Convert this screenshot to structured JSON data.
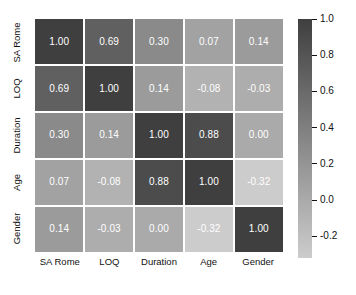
{
  "chart_data": {
    "type": "heatmap",
    "title": "",
    "subtitle": "",
    "xlabel": "",
    "ylabel": "",
    "categories_x": [
      "SA Rome",
      "LOQ",
      "Duration",
      "Age",
      "Gender"
    ],
    "categories_y": [
      "SA Rome",
      "LOQ",
      "Duration",
      "Age",
      "Gender"
    ],
    "values": [
      [
        1.0,
        0.69,
        0.3,
        0.07,
        0.14
      ],
      [
        0.69,
        1.0,
        0.14,
        -0.08,
        -0.03
      ],
      [
        0.3,
        0.14,
        1.0,
        0.88,
        0.0
      ],
      [
        0.07,
        -0.08,
        0.88,
        1.0,
        -0.32
      ],
      [
        0.14,
        -0.03,
        0.0,
        -0.32,
        1.0
      ]
    ],
    "cell_labels": [
      [
        "1.00",
        "0.69",
        "0.30",
        "0.07",
        "0.14"
      ],
      [
        "0.69",
        "1.00",
        "0.14",
        "-0.08",
        "-0.03"
      ],
      [
        "0.30",
        "0.14",
        "1.00",
        "0.88",
        "0.00"
      ],
      [
        "0.07",
        "-0.08",
        "0.88",
        "1.00",
        "-0.32"
      ],
      [
        "0.14",
        "-0.03",
        "0.00",
        "-0.32",
        "1.00"
      ]
    ],
    "grid": false,
    "legend_position": "right",
    "colorbar": {
      "ticks": [
        "1.0",
        "0.8",
        "0.6",
        "0.4",
        "0.2",
        "0.0",
        "-0.2"
      ],
      "tick_values": [
        1.0,
        0.8,
        0.6,
        0.4,
        0.2,
        0.0,
        -0.2
      ],
      "vmin": -0.32,
      "vmax": 1.0,
      "colormap": "grey-reversed",
      "color_high": "#3f3f3f",
      "color_low": "#cccccc"
    },
    "cell_text_color": "#ffffff",
    "background_color": "#ffffff"
  }
}
